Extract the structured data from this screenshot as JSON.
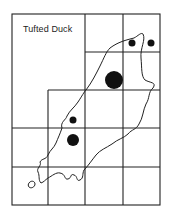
{
  "title": "Tufted Duck",
  "colors": {
    "ink": "#222222",
    "background": "#ffffff"
  },
  "grid": {
    "frame": {
      "left": 12,
      "top": 14,
      "right": 160,
      "bottom": 205
    },
    "verticals": [
      48,
      85,
      123
    ],
    "horizontals": [
      52,
      90,
      128,
      167
    ]
  },
  "records": [
    {
      "size": "small",
      "x": 132,
      "y": 43,
      "r": 3.5
    },
    {
      "size": "small",
      "x": 151,
      "y": 43,
      "r": 3.5
    },
    {
      "size": "large",
      "x": 114,
      "y": 80,
      "r": 9
    },
    {
      "size": "small",
      "x": 73,
      "y": 120,
      "r": 3.5
    },
    {
      "size": "medium",
      "x": 73,
      "y": 140,
      "r": 6
    }
  ]
}
